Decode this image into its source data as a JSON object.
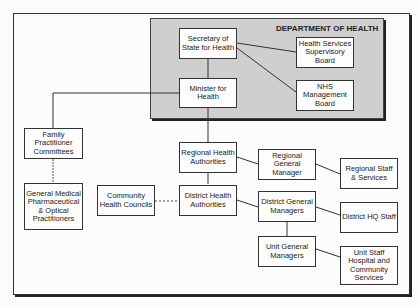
{
  "department": {
    "label": "DEPARTMENT OF HEALTH"
  },
  "nodes": {
    "secretary": "Secretary of State for Health",
    "hssb": "Health Services Supervisory Board",
    "minister": "Minister for Health",
    "nhs": "NHS Management Board",
    "fpc": "Family Practitioner Committees",
    "gmpop": "General Medical Pharmaceutical & Optical Practitioners",
    "rha": "Regional Health Authorities",
    "rgm": "Regional General Manager",
    "rss": "Regional Staff & Services",
    "chc": "Community Health Councils",
    "dha": "District Health Authorities",
    "dgm": "District General Managers",
    "dhq": "District HQ Staff",
    "ugm": "Unit General Managers",
    "unitstaff": "Unit Staff Hospital and Community Services"
  }
}
